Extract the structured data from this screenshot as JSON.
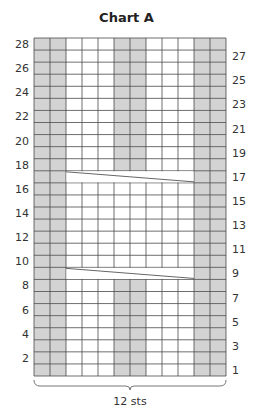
{
  "chart_data": {
    "type": "heatmap",
    "title": "Chart A",
    "columns": 12,
    "rows": 28,
    "width_label": "12 sts",
    "left_row_labels": [
      2,
      4,
      6,
      8,
      10,
      12,
      14,
      16,
      18,
      20,
      22,
      24,
      26,
      28
    ],
    "right_row_labels": [
      1,
      3,
      5,
      7,
      9,
      11,
      13,
      15,
      17,
      19,
      21,
      23,
      25,
      27
    ],
    "shaded_color": "#d3d3d3",
    "plain_color": "#ffffff",
    "grid_color": "#4a4a4a",
    "edge_shaded_columns": [
      1,
      2,
      11,
      12
    ],
    "center_columns": [
      6,
      7
    ],
    "center_shaded_rows": [
      1,
      2,
      3,
      4,
      5,
      6,
      7,
      8,
      18,
      19,
      20,
      21,
      22,
      23,
      24,
      25,
      26,
      27,
      28
    ],
    "cable_crosses": [
      {
        "row": 9,
        "from_column": 3,
        "to_column": 10
      },
      {
        "row": 17,
        "from_column": 3,
        "to_column": 10
      }
    ]
  }
}
